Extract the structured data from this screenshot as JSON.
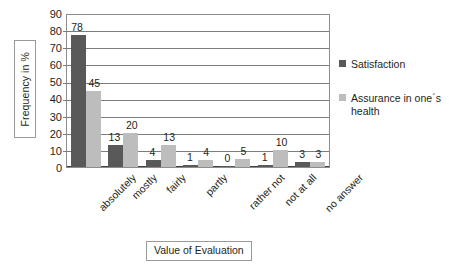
{
  "chart_data": {
    "type": "bar",
    "title": "",
    "xlabel": "Value of Evaluation",
    "ylabel": "Frequency in %",
    "ylim": [
      0,
      90
    ],
    "ytick_step": 10,
    "yticks": [
      "90",
      "80",
      "70",
      "60",
      "50",
      "40",
      "30",
      "20",
      "10",
      "0"
    ],
    "grid": "horizontal",
    "legend_position": "right",
    "categories": [
      "absolutely",
      "mostly",
      "fairly",
      "partly",
      "rather not",
      "not at all",
      "no answer"
    ],
    "series": [
      {
        "name": "Satisfaction",
        "color": "#595959",
        "values": [
          78,
          13,
          4,
          1,
          0,
          1,
          3
        ]
      },
      {
        "name": "Assurance in one´s health",
        "color": "#bdbdbd",
        "values": [
          45,
          20,
          13,
          4,
          5,
          10,
          3
        ]
      }
    ]
  }
}
